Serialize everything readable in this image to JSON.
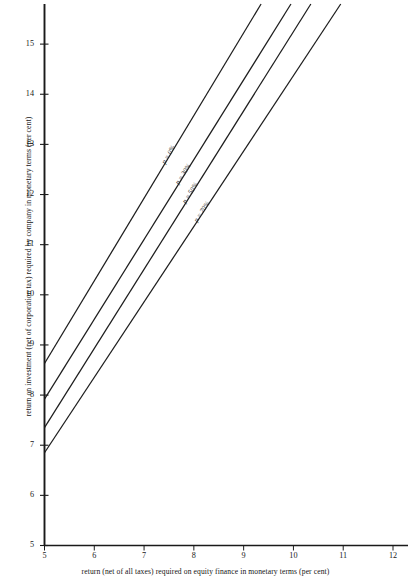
{
  "chart_data": {
    "type": "line",
    "title": "",
    "xlabel": "return (net of all taxes) required on equity finance in monetary terms (per cent)",
    "ylabel": "return on investment (net of corporation tax) required by company in monetary terms (per cent)",
    "xlim": [
      5,
      12
    ],
    "ylim": [
      5,
      15.8
    ],
    "xticks": [
      "5",
      "6",
      "7",
      "8",
      "9",
      "10",
      "11",
      "12"
    ],
    "xtick_values": [
      5,
      6,
      7,
      8,
      9,
      10,
      11,
      12
    ],
    "yticks": [
      "5",
      "6",
      "7",
      "8",
      "9",
      "10",
      "11",
      "12",
      "13",
      "14",
      "15"
    ],
    "ytick_values": [
      5,
      6,
      7,
      8,
      9,
      10,
      11,
      12,
      13,
      14,
      15
    ],
    "grid": false,
    "legend": "inline-labels-on-lines",
    "series": [
      {
        "name": "p = 0%",
        "label": "p = 0%",
        "x": [
          5,
          9.35
        ],
        "values": [
          8.63,
          15.8
        ],
        "intercept": 8.63,
        "slope": 1.648
      },
      {
        "name": "p = 30%",
        "label": "p = 30%",
        "x": [
          5,
          9.95
        ],
        "values": [
          7.92,
          15.8
        ],
        "intercept": 7.92,
        "slope": 1.592
      },
      {
        "name": "p = 50%",
        "label": "p = 50%",
        "x": [
          5,
          10.35
        ],
        "values": [
          7.35,
          15.8
        ],
        "intercept": 7.35,
        "slope": 1.579
      },
      {
        "name": "p = 70%",
        "label": "p = 70%",
        "x": [
          5,
          10.95
        ],
        "values": [
          6.85,
          15.8
        ],
        "intercept": 6.85,
        "slope": 1.504
      }
    ]
  },
  "axes": {
    "x_axis_name": "x-axis",
    "y_axis_name": "y-axis"
  }
}
